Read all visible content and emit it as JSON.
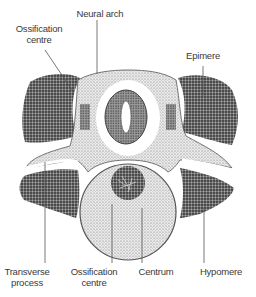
{
  "diagram": {
    "labels": {
      "ossification_top_l1": "Ossification",
      "ossification_top_l2": "centre",
      "neural_arch": "Neural arch",
      "epimere": "Epimere",
      "transverse_l1": "Transverse",
      "transverse_l2": "process",
      "ossification_bottom_l1": "Ossification",
      "ossification_bottom_l2": "centre",
      "centrum": "Centrum",
      "hypomere": "Hypomere"
    },
    "colors": {
      "dark_stipple": "#5a5a5a",
      "light_stipple": "#bdbdbd",
      "line": "#555555",
      "text": "#3a3a3a"
    }
  }
}
